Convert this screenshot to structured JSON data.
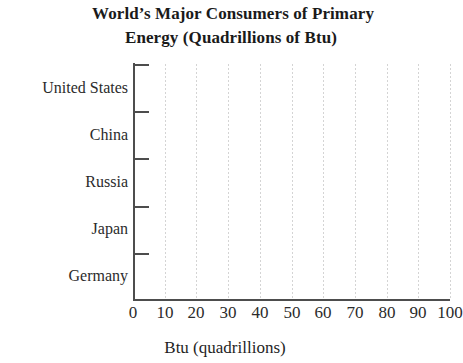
{
  "chart_data": {
    "type": "bar",
    "orientation": "horizontal",
    "title": "World’s Major Consumers of Primary Energy (Quadrillions of Btu)",
    "title_lines": [
      "World’s Major Consumers of Primary",
      "Energy (Quadrillions of Btu)"
    ],
    "categories": [
      "United States",
      "China",
      "Russia",
      "Japan",
      "Germany"
    ],
    "values": [
      null,
      null,
      null,
      null,
      null
    ],
    "series": [
      {
        "name": "Btu (quadrillions)",
        "values": [
          null,
          null,
          null,
          null,
          null
        ]
      }
    ],
    "xlabel": "Btu (quadrillions)",
    "ylabel": "",
    "xlim": [
      0,
      100
    ],
    "x_ticks": [
      "0",
      "10",
      "20",
      "30",
      "40",
      "50",
      "60",
      "70",
      "80",
      "90",
      "100"
    ],
    "x_tick_values": [
      0,
      10,
      20,
      30,
      40,
      50,
      60,
      70,
      80,
      90,
      100
    ],
    "x_tick_step": 10,
    "grid": "vertical-dotted",
    "legend": "none",
    "data_plotted": false,
    "note": "Blank grid — no bars drawn",
    "colors": {
      "axis": "#4d4d4d",
      "gridline": "#d4d4d4",
      "text": "#1a1a1a",
      "background": "#ffffff"
    }
  }
}
